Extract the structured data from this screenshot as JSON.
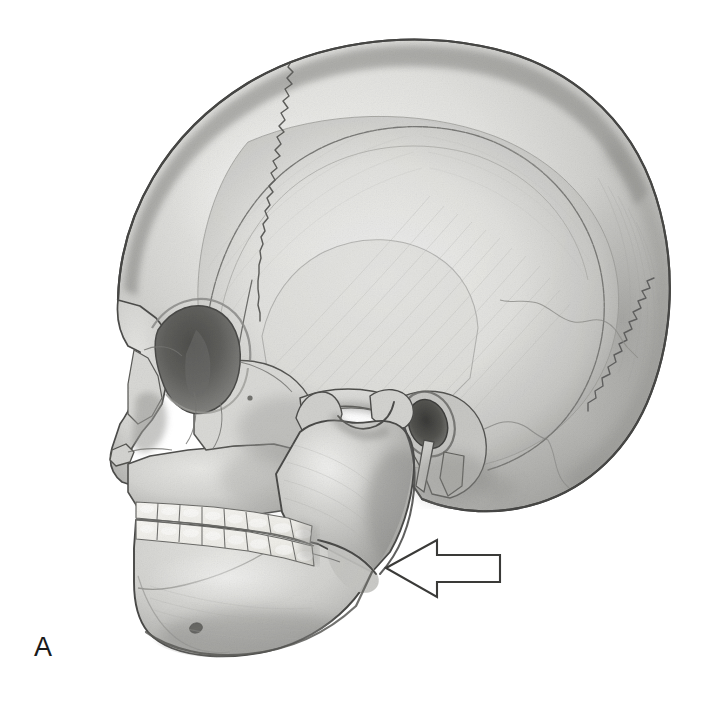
{
  "figure": {
    "panel_label": "A",
    "background_color": "#ffffff",
    "view": "left lateral profile of human skull",
    "medium": "grayscale pencil / airbrush anatomical illustration",
    "width": 707,
    "height": 712
  },
  "palette": {
    "background": "#ffffff",
    "bone_light": "#e9e9e7",
    "bone_mid": "#c9c9c6",
    "bone_shadow": "#a3a3a0",
    "bone_deep_shadow": "#7d7d7a",
    "outline": "#4a4a48",
    "suture_line": "#6e6e6b",
    "cavity_dark": "#5c5c59",
    "cavity_darkest": "#3d3d3b",
    "tooth_white": "#f4f3ef",
    "tooth_outline": "#6b6b68",
    "arrow_stroke": "#3a3a38",
    "arrow_fill": "#ffffff",
    "label_text": "#1a1a1a"
  },
  "annotations": {
    "arrow": {
      "name": "pointer-arrow",
      "direction": "left",
      "style": "outlined block arrow, unfilled",
      "tip_x": 386,
      "tip_y": 568,
      "tail_x": 500,
      "top_y": 540,
      "bottom_y": 597,
      "points_at": "mandibular angle (gonion)"
    }
  },
  "anatomy": {
    "regions": [
      {
        "name": "cranial-vault",
        "label": "Cranial vault (frontal/parietal/occipital)"
      },
      {
        "name": "frontal-bone",
        "label": "Frontal bone"
      },
      {
        "name": "parietal-bone",
        "label": "Parietal bone"
      },
      {
        "name": "occipital-bone",
        "label": "Occipital bone"
      },
      {
        "name": "temporal-bone",
        "label": "Temporal bone"
      },
      {
        "name": "coronal-suture",
        "label": "Coronal suture"
      },
      {
        "name": "lambdoid-suture",
        "label": "Lambdoid suture"
      },
      {
        "name": "squamosal-suture",
        "label": "Squamosal suture"
      },
      {
        "name": "orbit",
        "label": "Orbit (eye socket)"
      },
      {
        "name": "nasal-aperture",
        "label": "Nasal aperture"
      },
      {
        "name": "anterior-nasal-spine",
        "label": "Anterior nasal spine"
      },
      {
        "name": "zygomatic-arch",
        "label": "Zygomatic arch"
      },
      {
        "name": "external-auditory-meatus",
        "label": "External auditory meatus"
      },
      {
        "name": "styloid-process",
        "label": "Styloid process"
      },
      {
        "name": "mandibular-condyle",
        "label": "Mandibular condyle"
      },
      {
        "name": "mandibular-notch",
        "label": "Mandibular notch"
      },
      {
        "name": "coronoid-process",
        "label": "Coronoid process"
      },
      {
        "name": "mandibular-ramus",
        "label": "Ramus of mandible"
      },
      {
        "name": "mandibular-angle",
        "label": "Angle of mandible (gonion)"
      },
      {
        "name": "mandibular-body",
        "label": "Body of mandible"
      },
      {
        "name": "mental-foramen",
        "label": "Mental foramen"
      },
      {
        "name": "maxilla",
        "label": "Maxilla"
      },
      {
        "name": "upper-teeth",
        "label": "Maxillary (upper) dental arch"
      },
      {
        "name": "lower-teeth",
        "label": "Mandibular (lower) dental arch"
      }
    ],
    "upper_teeth_count": 8,
    "lower_teeth_count": 8
  }
}
